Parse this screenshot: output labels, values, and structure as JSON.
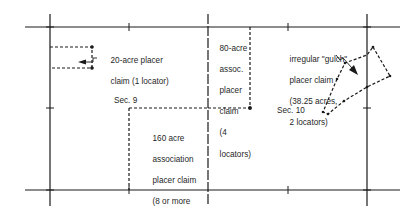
{
  "figure": {
    "type": "placer-claims-diagram",
    "sections": [
      {
        "id": "sec9",
        "label": "Sec. 9"
      },
      {
        "id": "sec10",
        "label": "Sec. 10"
      }
    ],
    "claims": [
      {
        "id": "claim20",
        "lines": [
          "20-acre placer",
          "claim (1 locator)"
        ]
      },
      {
        "id": "claim80",
        "lines": [
          "80-acre",
          "assoc.",
          "placer",
          "claim",
          "(4",
          "locators)"
        ]
      },
      {
        "id": "claim160",
        "lines": [
          "160 acre",
          "association",
          "placer claim",
          "(8 or more",
          "locators)"
        ]
      },
      {
        "id": "gulch",
        "lines": [
          "irregular \"gulch\"",
          "placer claim",
          "(38.25 acres,",
          "2 locators)"
        ]
      }
    ],
    "colors": {
      "line": "#1a1a1a",
      "background": "#ffffff"
    }
  }
}
